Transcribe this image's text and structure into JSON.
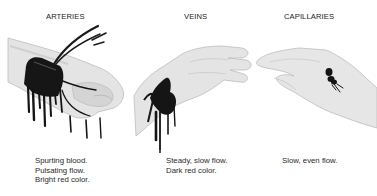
{
  "diagram": {
    "type": "illustration",
    "panels": [
      {
        "title": "ARTERIES",
        "illustration": "hand-with-spurting-blood",
        "caption": [
          "Spurting blood.",
          "Pulsating flow.",
          "Bright red color."
        ]
      },
      {
        "title": "VEINS",
        "illustration": "hand-with-flowing-blood",
        "caption": [
          "Steady, slow flow.",
          "Dark red color."
        ]
      },
      {
        "title": "CAPILLARIES",
        "illustration": "hand-with-oozing-blood",
        "caption": [
          "Slow, even flow."
        ]
      }
    ],
    "colors": {
      "background": "#ffffff",
      "skin": "#e6e6e6",
      "skin_shadow": "#c8c8c8",
      "blood": "#1a1a1a",
      "text": "#2a2a2a"
    }
  }
}
